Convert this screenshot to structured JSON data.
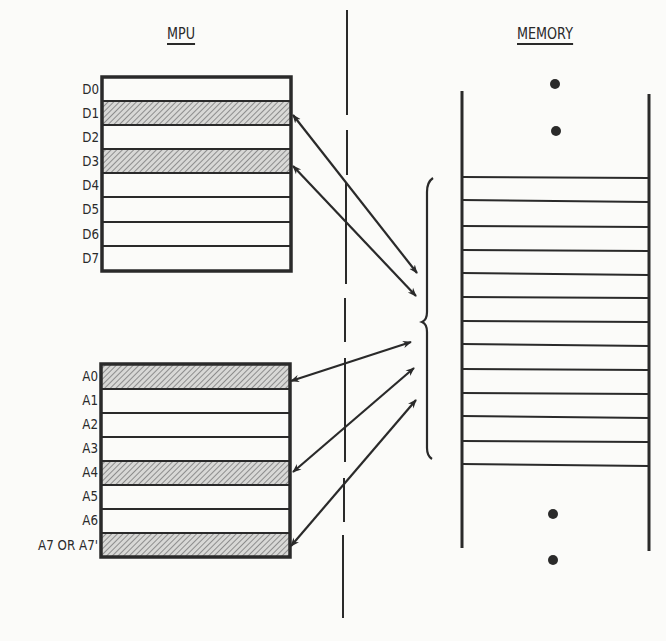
{
  "mpu": {
    "title": "MPU",
    "data_registers": [
      {
        "label": "D0",
        "highlighted": false
      },
      {
        "label": "D1",
        "highlighted": true
      },
      {
        "label": "D2",
        "highlighted": false
      },
      {
        "label": "D3",
        "highlighted": true
      },
      {
        "label": "D4",
        "highlighted": false
      },
      {
        "label": "D5",
        "highlighted": false
      },
      {
        "label": "D6",
        "highlighted": false
      },
      {
        "label": "D7",
        "highlighted": false
      }
    ],
    "address_registers": [
      {
        "label": "A0",
        "highlighted": true
      },
      {
        "label": "A1",
        "highlighted": false
      },
      {
        "label": "A2",
        "highlighted": false
      },
      {
        "label": "A3",
        "highlighted": false
      },
      {
        "label": "A4",
        "highlighted": true
      },
      {
        "label": "A5",
        "highlighted": false
      },
      {
        "label": "A6",
        "highlighted": false
      },
      {
        "label": "A7 OR A7'",
        "highlighted": true
      }
    ]
  },
  "memory": {
    "title": "MEMORY",
    "cell_count": 12,
    "ellipsis_dots_top": 2,
    "ellipsis_dots_bottom": 2
  },
  "connections": [
    {
      "from": "D1",
      "to": "memory-block"
    },
    {
      "from": "D3",
      "to": "memory-block"
    },
    {
      "from": "A0",
      "to": "memory-block"
    },
    {
      "from": "A4",
      "to": "memory-block"
    },
    {
      "from": "A7 OR A7'",
      "to": "memory-block"
    }
  ],
  "colors": {
    "ink": "#2a2a2a",
    "hatch": "#9a9a9a",
    "background": "#fbfbf9"
  }
}
